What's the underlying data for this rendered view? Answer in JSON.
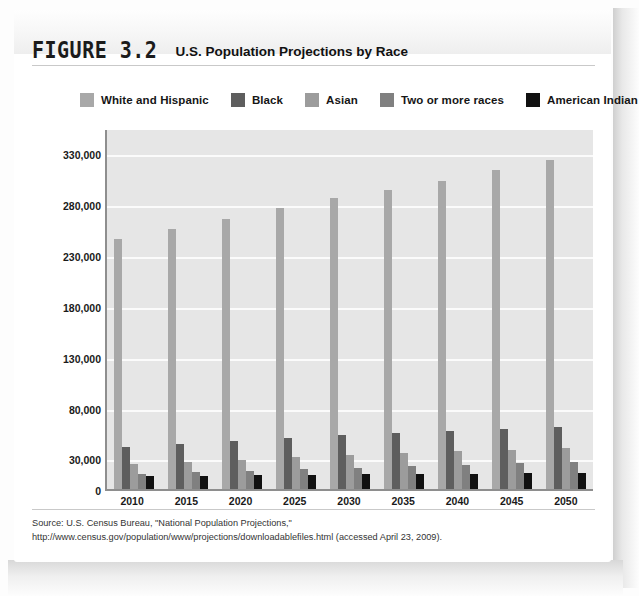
{
  "figure": {
    "number": "FIGURE 3.2",
    "title": "U.S. Population Projections by Race",
    "source": "Source: U.S. Census Bureau, \"National Population Projections,\" http://www.census.gov/population/www/projections/downloadablefiles.html (accessed April 23, 2009)."
  },
  "colors": {
    "white_and_hispanic": "#a8a8a8",
    "black": "#5e5e5e",
    "asian": "#9c9c9c",
    "two_or_more_races": "#808080",
    "american_indian": "#111111",
    "plot_background": "#e6e6e6",
    "gridline": "#fbfbfb",
    "axis": "#8e8e8e"
  },
  "chart_data": {
    "type": "bar",
    "title": "U.S. Population Projections by Race",
    "xlabel": "",
    "ylabel": "",
    "ylim": [
      0,
      355000
    ],
    "grid": true,
    "legend_position": "top",
    "categories": [
      "2010",
      "2015",
      "2020",
      "2025",
      "2030",
      "2035",
      "2040",
      "2045",
      "2050"
    ],
    "ytick_labels": [
      "330,000",
      "280,000",
      "230,000",
      "180,000",
      "130,000",
      "80,000",
      "30,000",
      "0"
    ],
    "ytick_values": [
      330000,
      280000,
      230000,
      180000,
      130000,
      80000,
      30000,
      0
    ],
    "series": [
      {
        "name": "White and Hispanic",
        "color": "#a8a8a8",
        "values": [
          246000,
          256000,
          266000,
          276000,
          286000,
          294000,
          303000,
          314000,
          324000
        ]
      },
      {
        "name": "Black",
        "color": "#5e5e5e",
        "values": [
          41000,
          44000,
          47000,
          50000,
          53000,
          55000,
          57000,
          59000,
          61000
        ]
      },
      {
        "name": "Asian",
        "color": "#9c9c9c",
        "values": [
          25000,
          27000,
          29000,
          31000,
          33000,
          35000,
          37000,
          38000,
          40000
        ]
      },
      {
        "name": "Two or more races",
        "color": "#808080",
        "values": [
          15000,
          17000,
          18000,
          20000,
          21000,
          23000,
          24000,
          26000,
          27000
        ]
      },
      {
        "name": "American Indian",
        "color": "#111111",
        "values": [
          13000,
          13000,
          14000,
          14000,
          15000,
          15000,
          15000,
          16000,
          16000
        ]
      }
    ]
  }
}
